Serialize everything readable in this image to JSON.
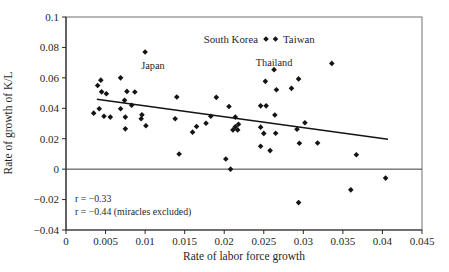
{
  "figure": {
    "width": 449,
    "height": 272
  },
  "colors": {
    "background": "#ffffff",
    "text": "#1f1f1f",
    "marker": "#141414",
    "trend_line": "#141414",
    "zero_line": "#3a3a3a",
    "axis": "#2a2a2a",
    "frame": "#707070"
  },
  "chart_data": {
    "type": "scatter",
    "title": "",
    "xlabel": "Rate of labor force growth",
    "ylabel": "Rate of growth of K/L",
    "xlim": [
      0,
      0.045
    ],
    "ylim": [
      -0.04,
      0.1
    ],
    "grid": false,
    "x_ticks": [
      0,
      0.005,
      0.01,
      0.015,
      0.02,
      0.025,
      0.03,
      0.035,
      0.04,
      0.045
    ],
    "x_tick_labels": [
      "0",
      "0.005",
      "0.01",
      "0.015",
      "0.02",
      "0.025",
      "0.03",
      "0.035",
      "0.04",
      "0.045"
    ],
    "y_ticks": [
      0.1,
      0.08,
      0.06,
      0.04,
      0.02,
      0,
      -0.02,
      -0.04
    ],
    "y_tick_labels": [
      "0.1",
      "0.08",
      "0.06",
      "0.04",
      "0.02",
      "0",
      "−0.02",
      "−0.04"
    ],
    "legend": {
      "position": "top-inside",
      "marker": "diamond",
      "entries": [
        {
          "label": "South Korea"
        },
        {
          "label": "Taiwan"
        }
      ]
    },
    "marker": {
      "shape": "diamond",
      "size": 2.8
    },
    "points": [
      [
        0.01,
        0.077
      ],
      [
        0.0069,
        0.06
      ],
      [
        0.0044,
        0.0585
      ],
      [
        0.004,
        0.055
      ],
      [
        0.0045,
        0.0508
      ],
      [
        0.0051,
        0.0496
      ],
      [
        0.0077,
        0.0511
      ],
      [
        0.0087,
        0.0507
      ],
      [
        0.0074,
        0.0452
      ],
      [
        0.0083,
        0.042
      ],
      [
        0.0069,
        0.0397
      ],
      [
        0.0042,
        0.0397
      ],
      [
        0.0035,
        0.0368
      ],
      [
        0.0048,
        0.0348
      ],
      [
        0.0056,
        0.0342
      ],
      [
        0.0075,
        0.0342
      ],
      [
        0.0096,
        0.0357
      ],
      [
        0.0095,
        0.0331
      ],
      [
        0.0075,
        0.0265
      ],
      [
        0.0101,
        0.0285
      ],
      [
        0.014,
        0.0474
      ],
      [
        0.0138,
        0.0331
      ],
      [
        0.0143,
        0.01
      ],
      [
        0.019,
        0.0472
      ],
      [
        0.0206,
        0.0412
      ],
      [
        0.0165,
        0.028
      ],
      [
        0.0177,
        0.0302
      ],
      [
        0.0183,
        0.0348
      ],
      [
        0.016,
        0.0243
      ],
      [
        0.0214,
        0.0342
      ],
      [
        0.0218,
        0.0295
      ],
      [
        0.0211,
        0.0258
      ],
      [
        0.0217,
        0.0258
      ],
      [
        0.0214,
        0.0278
      ],
      [
        0.0202,
        0.0067
      ],
      [
        0.0208,
        0.0
      ],
      [
        0.0263,
        0.0654
      ],
      [
        0.0294,
        0.0593
      ],
      [
        0.0252,
        0.0577
      ],
      [
        0.0285,
        0.0531
      ],
      [
        0.0266,
        0.0522
      ],
      [
        0.0246,
        0.0416
      ],
      [
        0.0253,
        0.0416
      ],
      [
        0.0264,
        0.0356
      ],
      [
        0.0246,
        0.0276
      ],
      [
        0.025,
        0.0235
      ],
      [
        0.0265,
        0.0236
      ],
      [
        0.0258,
        0.0122
      ],
      [
        0.0246,
        0.015
      ],
      [
        0.0295,
        0.017
      ],
      [
        0.0292,
        0.0262
      ],
      [
        0.0302,
        0.0305
      ],
      [
        0.0318,
        0.0172
      ],
      [
        0.0367,
        0.0095
      ],
      [
        0.0294,
        -0.022
      ],
      [
        0.036,
        -0.0136
      ],
      [
        0.0404,
        -0.0059
      ],
      [
        0.0336,
        0.0695
      ]
    ],
    "point_labels": [
      {
        "text": "Japan",
        "x": 0.011,
        "y": 0.068
      },
      {
        "text": "Thailand",
        "x": 0.0263,
        "y": 0.07
      }
    ],
    "zero_line": 0,
    "trend_line": {
      "x1": 0.0039,
      "y1": 0.0459,
      "x2": 0.0407,
      "y2": 0.0196
    },
    "annotations": [
      {
        "text": "r = −0.33"
      },
      {
        "text": "r = −0.44 (miracles excluded)"
      }
    ]
  }
}
